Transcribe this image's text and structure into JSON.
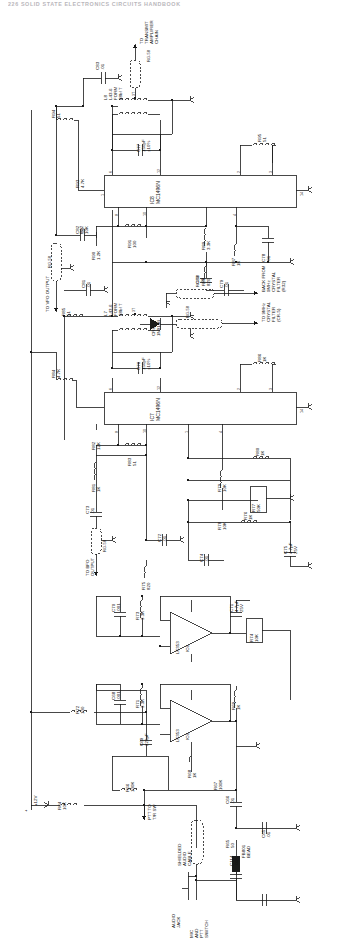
{
  "page": {
    "header": "226      SOLID STATE ELECTRONICS CIRCUITS HANDBOOK",
    "ink_color": "#1a1a1a",
    "paper_color": "#ffffff"
  },
  "ics": [
    {
      "ref": "IC8",
      "type": "MC1496N",
      "pins": [
        "6",
        "12",
        "2",
        "3",
        "8",
        "10",
        "4",
        "1",
        "14"
      ]
    },
    {
      "ref": "IC7",
      "type": "MC1496N",
      "pins": [
        "6",
        "12",
        "2",
        "3",
        "8",
        "10",
        "1",
        "4",
        "14"
      ]
    },
    {
      "ref": "IC6",
      "type": "LF353",
      "section": "A",
      "pins": [
        "5",
        "6",
        "7",
        "4"
      ]
    },
    {
      "ref": "IC6",
      "type": "LF353",
      "section": "B",
      "pins": [
        "3",
        "2",
        "1",
        "8"
      ]
    }
  ],
  "nets": [
    {
      "name": "to-transmit-amp",
      "label": "TO\nTRANSMIT\nAMPLIFIER\nCHAIN",
      "cable": "RG-58"
    },
    {
      "name": "to-vfo-output",
      "label": "TO VFO OUTPUT",
      "cable": "RG-58"
    },
    {
      "name": "to-bfo-output",
      "label": "TO BFO\nOUTPUT",
      "cable": "RG-58"
    },
    {
      "name": "back-from-filter",
      "label": "BACK FROM\n9MHz\nCRYSTAL\nFILTER\n(R32)",
      "cable": "RG-58"
    },
    {
      "name": "to-filter",
      "label": "TO 9MHz\nCRYSTAL\nFILTER\n(CR-5)",
      "cable": "RG-58"
    },
    {
      "name": "ptt-to-tr-sw",
      "label": "PTT TO\nT/R SW",
      "cable": ""
    },
    {
      "name": "supply-12v",
      "label": "+12V",
      "cable": ""
    },
    {
      "name": "supply-plus",
      "label": "+",
      "cable": ""
    },
    {
      "name": "shielded-audio-cable",
      "label": "SHIELDED\nAUDIO\nCABLE",
      "cable": ""
    },
    {
      "name": "audio-jack",
      "label": "AUDIO\nJACK",
      "cable": ""
    },
    {
      "name": "mic-ptt",
      "label": "MIC\nAND\nPTT\nSWITCH",
      "cable": ""
    }
  ],
  "components": [
    {
      "ref": "C83",
      "value": ".01",
      "type": "capacitor"
    },
    {
      "ref": "L8",
      "value": "L43-6\nFORM\n88bf T",
      "type": "coil"
    },
    {
      "ref": "C77",
      "value": "150pF\n±10%",
      "type": "capacitor"
    },
    {
      "ref": "R95",
      "value": "51",
      "type": "resistor"
    },
    {
      "ref": "R94",
      "value": "51",
      "type": "resistor"
    },
    {
      "ref": "R93",
      "value": "4.7K",
      "type": "resistor"
    },
    {
      "ref": "R92",
      "value": "10K",
      "type": "resistor"
    },
    {
      "ref": "R90",
      "value": "1.2K",
      "type": "resistor"
    },
    {
      "ref": "R91",
      "value": "100",
      "type": "resistor"
    },
    {
      "ref": "R89",
      "value": "3.3K",
      "type": "resistor"
    },
    {
      "ref": "R88",
      "value": "820",
      "type": "resistor"
    },
    {
      "ref": "R87",
      "value": "1K",
      "type": "resistor"
    },
    {
      "ref": "C78",
      "value": ".01",
      "type": "capacitor"
    },
    {
      "ref": "C82",
      "value": ".01",
      "type": "capacitor"
    },
    {
      "ref": "C80",
      "value": ".01",
      "type": "capacitor"
    },
    {
      "ref": "C79",
      "value": ".01",
      "type": "capacitor"
    },
    {
      "ref": "C81",
      "value": ".01",
      "type": "capacitor"
    },
    {
      "ref": "CR8",
      "value": "1N914B",
      "type": "diode"
    },
    {
      "ref": "L7",
      "value": "L43-6\nFORM\n88bf T",
      "type": "coil"
    },
    {
      "ref": "R85",
      "value": "51",
      "type": "resistor"
    },
    {
      "ref": "C76",
      "value": "150pF\n±10%",
      "type": "capacitor"
    },
    {
      "ref": "R86",
      "value": "1K",
      "type": "resistor"
    },
    {
      "ref": "R84",
      "value": "4.7K",
      "type": "resistor"
    },
    {
      "ref": "R82",
      "value": "12K",
      "type": "resistor"
    },
    {
      "ref": "R83",
      "value": "51",
      "type": "resistor"
    },
    {
      "ref": "R81",
      "value": "1K",
      "type": "resistor"
    },
    {
      "ref": "R80",
      "value": "1K",
      "type": "resistor"
    },
    {
      "ref": "R79",
      "value": "10K",
      "type": "resistor"
    },
    {
      "ref": "R78",
      "value": "10K",
      "type": "resistor"
    },
    {
      "ref": "R77",
      "value": "50K",
      "type": "potentiometer"
    },
    {
      "ref": "R76",
      "value": "1K",
      "type": "resistor"
    },
    {
      "ref": "C73",
      "value": ".01",
      "type": "capacitor"
    },
    {
      "ref": "C72",
      "value": ".01",
      "type": "capacitor"
    },
    {
      "ref": "C74",
      "value": ".01",
      "type": "capacitor"
    },
    {
      "ref": "C75",
      "value": "4.7µF\n25V",
      "type": "capacitor"
    },
    {
      "ref": "R75",
      "value": "820",
      "type": "resistor"
    },
    {
      "ref": "C71",
      "value": "4.7µF\n25V",
      "type": "capacitor"
    },
    {
      "ref": "C70",
      "value": ".001",
      "type": "capacitor"
    },
    {
      "ref": "R73",
      "value": "3.3K",
      "type": "resistor"
    },
    {
      "ref": "R74",
      "value": "10K",
      "type": "potentiometer"
    },
    {
      "ref": "C68",
      "value": ".001",
      "type": "capacitor"
    },
    {
      "ref": "R71",
      "value": "3.3K",
      "type": "resistor"
    },
    {
      "ref": "R69",
      "value": "1K",
      "type": "resistor"
    },
    {
      "ref": "R72",
      "value": "100",
      "type": "resistor"
    },
    {
      "ref": "C69",
      "value": "220µF",
      "type": "capacitor"
    },
    {
      "ref": "R68",
      "value": "1K",
      "type": "resistor"
    },
    {
      "ref": "R67",
      "value": "100K",
      "type": "resistor"
    },
    {
      "ref": "R66",
      "value": "100K",
      "type": "resistor"
    },
    {
      "ref": "C66",
      "value": ".01",
      "type": "capacitor"
    },
    {
      "ref": "C65",
      "value": ".01",
      "type": "capacitor"
    },
    {
      "ref": "R65",
      "value": "50",
      "type": "potentiometer"
    },
    {
      "ref": "FB801",
      "value": "BEAD",
      "type": "ferrite-bead"
    },
    {
      "ref": "R64",
      "value": "10K",
      "type": "resistor"
    },
    {
      "ref": "C114",
      "value": ".01",
      "type": "capacitor"
    }
  ]
}
